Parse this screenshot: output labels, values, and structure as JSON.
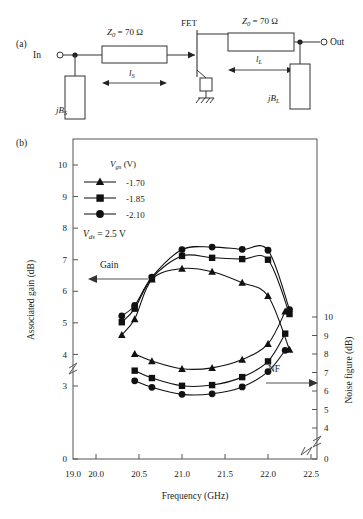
{
  "figure": {
    "panel_a_label": "(a)",
    "panel_b_label": "(b)"
  },
  "circuit": {
    "in_label": "In",
    "out_label": "Out",
    "fet_label": "FET",
    "z0_source": "Z0 = 70 Ω",
    "z0_load": "Z0 = 70 Ω",
    "len_source": "lS",
    "len_load": "lL",
    "susceptance_source": "jBS",
    "susceptance_load": "jBL",
    "ground_name": "ground-symbol"
  },
  "chart_data": {
    "type": "line",
    "title": "",
    "xlabel": "Frequency (GHz)",
    "ylabel": "Associated gain (dB)",
    "y2label": "Noise figure (dB)",
    "xlim": [
      19.0,
      22.5
    ],
    "xticks": [
      19.0,
      20.0,
      20.5,
      21.0,
      21.5,
      22.0,
      22.5
    ],
    "xtick_labels": [
      "19.0",
      "20.0",
      "20.5",
      "21.0",
      "21.5",
      "22.0",
      "22.5"
    ],
    "x_axis_break_after": "19.0",
    "ylim": [
      3,
      10
    ],
    "yticks": [
      3,
      4,
      5,
      6,
      7,
      8,
      9,
      10
    ],
    "ytick_labels": [
      "3",
      "4",
      "5",
      "6",
      "7",
      "8",
      "9",
      "10"
    ],
    "y_zero_tick": "0",
    "y_axis_break": true,
    "y2lim": [
      4,
      10
    ],
    "y2ticks": [
      4,
      5,
      6,
      7,
      8,
      9,
      10
    ],
    "y2tick_labels": [
      "4",
      "5",
      "6",
      "7",
      "8",
      "9",
      "10"
    ],
    "y2_zero_tick": "0",
    "y2_axis_break": true,
    "grid": false,
    "legend_position": "upper-left-inside",
    "legend_title": "Vgs (V)",
    "annotations": [
      {
        "text": "Vds = 2.5 V",
        "name": "vds-annotation"
      },
      {
        "text": "Gain",
        "name": "gain-annotation",
        "arrow": "left"
      },
      {
        "text": "NF",
        "name": "nf-annotation",
        "arrow": "right"
      }
    ],
    "series": [
      {
        "name": "-1.70",
        "marker": "triangle",
        "quantity": "Associated gain (dB)",
        "axis": "left",
        "x": [
          20.3,
          20.45,
          20.65,
          21.0,
          21.35,
          21.7,
          22.0,
          22.25
        ],
        "values": [
          4.62,
          5.12,
          6.38,
          6.72,
          6.62,
          6.27,
          5.85,
          4.15
        ]
      },
      {
        "name": "-1.85",
        "marker": "square",
        "quantity": "Associated gain (dB)",
        "axis": "left",
        "x": [
          20.3,
          20.45,
          20.65,
          21.0,
          21.35,
          21.7,
          22.0,
          22.25
        ],
        "values": [
          5.02,
          5.45,
          6.42,
          7.12,
          7.06,
          7.02,
          7.0,
          5.28
        ]
      },
      {
        "name": "-2.10",
        "marker": "circle",
        "quantity": "Associated gain (dB)",
        "axis": "left",
        "x": [
          20.3,
          20.45,
          20.65,
          21.0,
          21.35,
          21.7,
          22.0,
          22.25
        ],
        "values": [
          5.22,
          5.55,
          6.45,
          7.32,
          7.4,
          7.33,
          7.3,
          5.42
        ]
      },
      {
        "name": "-1.70",
        "marker": "triangle",
        "quantity": "Noise figure (dB)",
        "axis": "right",
        "x": [
          20.45,
          20.65,
          21.0,
          21.35,
          21.7,
          22.0,
          22.2
        ],
        "values": [
          8.0,
          7.62,
          7.2,
          7.25,
          7.7,
          8.55,
          10.3
        ]
      },
      {
        "name": "-1.85",
        "marker": "square",
        "quantity": "Noise figure (dB)",
        "axis": "right",
        "x": [
          20.45,
          20.65,
          21.0,
          21.35,
          21.7,
          22.0,
          22.2
        ],
        "values": [
          7.1,
          6.7,
          6.28,
          6.32,
          6.75,
          7.6,
          9.1
        ]
      },
      {
        "name": "-2.10",
        "marker": "circle",
        "quantity": "Noise figure (dB)",
        "axis": "right",
        "x": [
          20.45,
          20.65,
          21.0,
          21.35,
          21.7,
          22.0,
          22.2
        ],
        "values": [
          6.55,
          6.2,
          5.82,
          5.85,
          6.22,
          7.05,
          8.2
        ]
      }
    ]
  },
  "legend": {
    "title": "Vgs (V)",
    "items": [
      {
        "label": "-1.70",
        "marker": "triangle"
      },
      {
        "label": "-1.85",
        "marker": "square"
      },
      {
        "label": "-2.10",
        "marker": "circle"
      }
    ]
  }
}
